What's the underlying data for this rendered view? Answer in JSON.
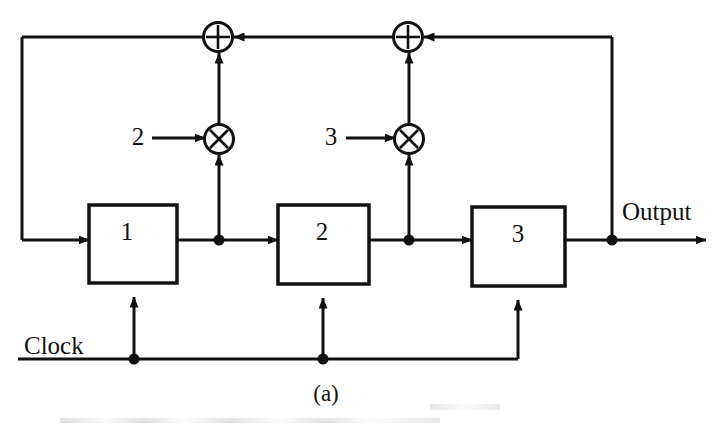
{
  "figure": {
    "caption": "(a)",
    "type": "block-diagram"
  },
  "registers": [
    {
      "id": "reg-1",
      "label": "1"
    },
    {
      "id": "reg-2",
      "label": "2"
    },
    {
      "id": "reg-3",
      "label": "3"
    }
  ],
  "multipliers": [
    {
      "id": "mult-1",
      "coefficient_label": "2",
      "symbol": "multiply"
    },
    {
      "id": "mult-2",
      "coefficient_label": "3",
      "symbol": "multiply"
    }
  ],
  "adders": [
    {
      "id": "adder-1",
      "symbol": "plus"
    },
    {
      "id": "adder-2",
      "symbol": "plus"
    }
  ],
  "signals": {
    "clock_label": "Clock",
    "output_label": "Output"
  },
  "colors": {
    "line": "#111111",
    "text": "#111111",
    "background": "#ffffff"
  }
}
